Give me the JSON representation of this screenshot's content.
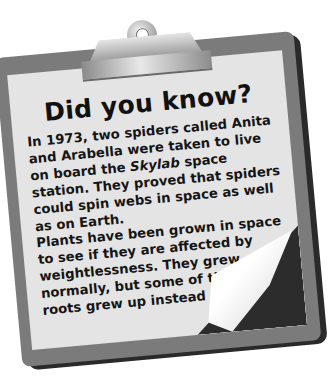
{
  "card": {
    "title": "Did you know?",
    "paragraph1": {
      "before": "In 1973, two spiders called Anita and Arabella were taken to live on board the ",
      "emphasis": "Skylab",
      "after": " space station. They proved that spiders could spin webs in space as well as on Earth."
    },
    "paragraph2": "Plants have been grown in space to see if they are affected by weightlessness. They grew normally, but some of the plants’ roots grew up instead of down."
  },
  "colors": {
    "board": "#7b7b7b",
    "paper": "#e4e4e4",
    "text": "#151515",
    "shadow": "#2a2a2a"
  },
  "icons": {
    "clip": "clipboard-clip-icon",
    "page_curl": "page-curl-icon"
  }
}
